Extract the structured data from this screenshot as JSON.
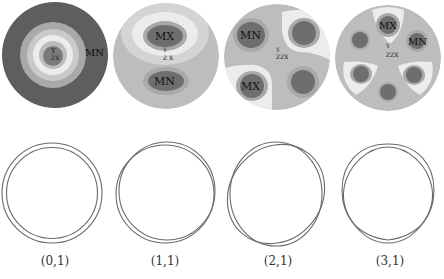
{
  "figure": {
    "colors": {
      "background": "#ffffff",
      "level_darkest": "#5e5e5e",
      "level_dark": "#808080",
      "level_mid": "#a9a9a9",
      "level_base": "#bdbdbd",
      "level_light": "#d4d4d4",
      "level_lightest": "#ececec",
      "outline": "#6a6a6a"
    },
    "modes": [
      {
        "label": "(0,1)",
        "contour_labels": {
          "max": "",
          "min": "MN"
        },
        "axis_labels": {
          "y": "Y",
          "zx": "ZX"
        }
      },
      {
        "label": "(1,1)",
        "contour_labels": {
          "max": "MX",
          "min": "MN"
        },
        "axis_labels": {
          "y": "Y",
          "zx": "Z X"
        }
      },
      {
        "label": "(2,1)",
        "contour_labels": {
          "max": "MX",
          "min": "MN"
        },
        "axis_labels": {
          "y": "Y",
          "zx": "ZZX"
        }
      },
      {
        "label": "(3,1)",
        "contour_labels": {
          "max": "MX",
          "min": "MN"
        },
        "axis_labels": {
          "y": "Y",
          "zx": "ZZX"
        }
      }
    ]
  }
}
